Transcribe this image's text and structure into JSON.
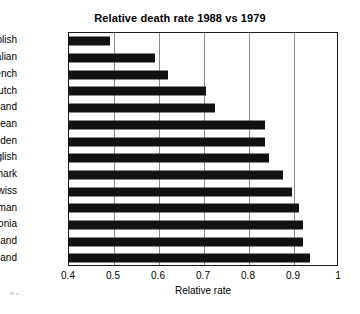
{
  "chart_data": {
    "type": "bar",
    "orientation": "horizontal",
    "title": "Relative death rate 1988 vs 1979",
    "xlabel": "Relative rate",
    "ylabel": "",
    "categories": [
      "Polish",
      "Italian",
      "French",
      "Dutch",
      "Finland",
      "Wtd mean",
      "Sweden",
      "English",
      "Denmark",
      "Swiss",
      "German",
      "Estonia",
      "Scotland",
      "Iceland"
    ],
    "values": [
      0.49,
      0.59,
      0.62,
      0.705,
      0.725,
      0.835,
      0.835,
      0.845,
      0.875,
      0.895,
      0.91,
      0.92,
      0.92,
      0.935
    ],
    "xlim": [
      0.4,
      1.0
    ],
    "xticks": [
      0.4,
      0.5,
      0.6,
      0.7,
      0.8,
      0.9,
      1
    ],
    "xtick_labels": [
      "0.4",
      "0.5",
      "0.6",
      "0.7",
      "0.8",
      "0.9",
      "1"
    ],
    "grid": "vertical",
    "legend": "none",
    "bar_color": "#121212"
  }
}
